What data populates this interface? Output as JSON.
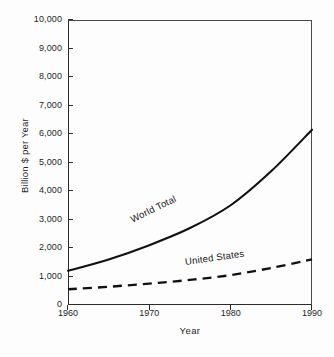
{
  "chart_data": {
    "type": "line",
    "title": "",
    "xlabel": "Year",
    "ylabel": "Billion $ per Year",
    "xlim": [
      1960,
      1990
    ],
    "ylim": [
      0,
      10000
    ],
    "grid": false,
    "legend_position": "inline-curve-labels",
    "x_ticks": [
      1960,
      1970,
      1980,
      1990
    ],
    "x_tick_labels": [
      "1960",
      "1970",
      "1980",
      "1990"
    ],
    "y_ticks": [
      0,
      1000,
      2000,
      3000,
      4000,
      5000,
      6000,
      7000,
      8000,
      9000,
      10000
    ],
    "y_tick_labels": [
      "0",
      "1,000",
      "2,000",
      "3,000",
      "4,000",
      "5,000",
      "6,000",
      "7,000",
      "8,000",
      "9,000",
      "10,000"
    ],
    "x": [
      1960,
      1965,
      1970,
      1975,
      1980,
      1985,
      1990
    ],
    "series": [
      {
        "name": "World Total",
        "style": "solid",
        "color": "#111111",
        "values": [
          1200,
          1600,
          2100,
          2700,
          3500,
          4700,
          6150
        ]
      },
      {
        "name": "United States",
        "style": "dashed",
        "color": "#111111",
        "values": [
          550,
          640,
          750,
          880,
          1050,
          1300,
          1600
        ]
      }
    ],
    "annotations": [
      {
        "text": "World Total",
        "x": 1974,
        "y": 2600
      },
      {
        "text": "United States",
        "x": 1981,
        "y": 1500
      }
    ]
  },
  "axis": {
    "y_title": "Billion $ per Year",
    "x_title": "Year"
  },
  "labels": {
    "world_total": "World Total",
    "united_states": "United States"
  },
  "colors": {
    "axis": "#2b2b2b",
    "series": "#111111",
    "background": "#fdfdfd"
  }
}
